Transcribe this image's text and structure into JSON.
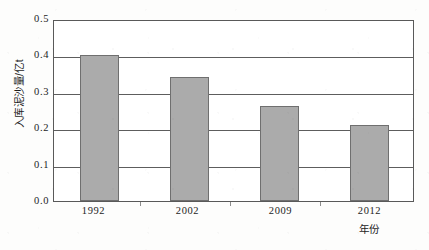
{
  "chart_data": {
    "type": "bar",
    "title": "",
    "categories": [
      "1992",
      "2002",
      "2009",
      "2012"
    ],
    "values": [
      0.4,
      0.34,
      0.26,
      0.21
    ],
    "series": [
      {
        "name": "入库泥沙量",
        "values": [
          0.4,
          0.34,
          0.26,
          0.21
        ]
      }
    ],
    "xlabel": "年份",
    "ylabel": "入库泥沙量/亿t",
    "ylim": [
      0.0,
      0.5
    ],
    "ytick_labels": [
      "0.5",
      "0.4",
      "0.3",
      "0.2",
      "0.1",
      "0.0"
    ],
    "ytick_values": [
      0.5,
      0.4,
      0.3,
      0.2,
      0.1,
      0.0
    ],
    "ystep": 0.1,
    "grid": "horizontal",
    "legend": "none",
    "bar_fill_color": "#ababab",
    "bar_border_color": "#6f6f6f",
    "axis_color": "#595959",
    "gridline_color": "#5d5d5d",
    "plot_background": "#ffffff",
    "page_background": "#fdfdfc"
  }
}
